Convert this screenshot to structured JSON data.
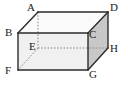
{
  "figure": {
    "type": "geometry-diagram",
    "shape": "rectangular-cuboid",
    "projection": "oblique",
    "title": "",
    "colors": {
      "stroke": "#2b2b2b",
      "hidden_stroke": "#8a8a8a",
      "face_front": "#f0f0f0",
      "face_top": "#fafafa",
      "face_right": "#c8c8c8",
      "label": "#1a1a1a",
      "background": "#ffffff"
    },
    "vertices": [
      {
        "id": "A",
        "label": "A",
        "x": 38,
        "y": 12,
        "hidden": false,
        "label_x": 27,
        "label_y": 2
      },
      {
        "id": "D",
        "label": "D",
        "x": 108,
        "y": 12,
        "hidden": false,
        "label_x": 110,
        "label_y": 2
      },
      {
        "id": "B",
        "label": "B",
        "x": 18,
        "y": 33,
        "hidden": false,
        "label_x": 5,
        "label_y": 27
      },
      {
        "id": "C",
        "label": "C",
        "x": 88,
        "y": 33,
        "hidden": false,
        "label_x": 89,
        "label_y": 29
      },
      {
        "id": "E",
        "label": "E",
        "x": 38,
        "y": 48,
        "hidden": true,
        "label_x": 29,
        "label_y": 41
      },
      {
        "id": "H",
        "label": "H",
        "x": 108,
        "y": 48,
        "hidden": false,
        "label_x": 110,
        "label_y": 43
      },
      {
        "id": "F",
        "label": "F",
        "x": 18,
        "y": 70,
        "hidden": false,
        "label_x": 5,
        "label_y": 65
      },
      {
        "id": "G",
        "label": "G",
        "x": 88,
        "y": 70,
        "hidden": false,
        "label_x": 89,
        "label_y": 69
      }
    ],
    "faces": [
      {
        "id": "front",
        "name": "face-front-BCGF",
        "points": "18,33 88,33 88,70 18,70",
        "fill": "#f0f0f0"
      },
      {
        "id": "top",
        "name": "face-top-ABCD",
        "points": "38,12 108,12 88,33 18,33",
        "fill": "#fafafa"
      },
      {
        "id": "right",
        "name": "face-right-CDHG",
        "points": "88,33 108,12 108,48 88,70",
        "fill": "#c8c8c8"
      }
    ],
    "edges_visible": [
      {
        "id": "AD",
        "name": "edge-A-D",
        "x1": 38,
        "y1": 12,
        "x2": 108,
        "y2": 12
      },
      {
        "id": "AB",
        "name": "edge-A-B",
        "x1": 38,
        "y1": 12,
        "x2": 18,
        "y2": 33
      },
      {
        "id": "DC",
        "name": "edge-D-C",
        "x1": 108,
        "y1": 12,
        "x2": 88,
        "y2": 33
      },
      {
        "id": "DH",
        "name": "edge-D-H",
        "x1": 108,
        "y1": 12,
        "x2": 108,
        "y2": 48
      },
      {
        "id": "BC",
        "name": "edge-B-C",
        "x1": 18,
        "y1": 33,
        "x2": 88,
        "y2": 33
      },
      {
        "id": "BF",
        "name": "edge-B-F",
        "x1": 18,
        "y1": 33,
        "x2": 18,
        "y2": 70
      },
      {
        "id": "CG",
        "name": "edge-C-G",
        "x1": 88,
        "y1": 33,
        "x2": 88,
        "y2": 70
      },
      {
        "id": "FG",
        "name": "edge-F-G",
        "x1": 18,
        "y1": 70,
        "x2": 88,
        "y2": 70
      },
      {
        "id": "GH",
        "name": "edge-G-H",
        "x1": 88,
        "y1": 70,
        "x2": 108,
        "y2": 48
      }
    ],
    "edges_hidden": [
      {
        "id": "AE",
        "name": "edge-A-E-hidden",
        "x1": 38,
        "y1": 12,
        "x2": 38,
        "y2": 48
      },
      {
        "id": "EH",
        "name": "edge-E-H-hidden",
        "x1": 38,
        "y1": 48,
        "x2": 108,
        "y2": 48
      },
      {
        "id": "EF",
        "name": "edge-E-F-hidden",
        "x1": 38,
        "y1": 48,
        "x2": 18,
        "y2": 70
      }
    ]
  }
}
